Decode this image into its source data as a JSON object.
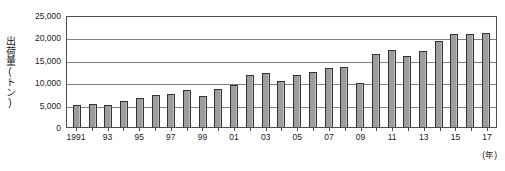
{
  "chart_data": {
    "type": "bar",
    "title": "",
    "subtitle": "",
    "xlabel": "(年)",
    "ylabel": "出荷量(トン)",
    "ylim": [
      0,
      25000
    ],
    "ytick_labels": [
      "25,000",
      "20,000",
      "15,000",
      "10,000",
      "5,000",
      "0"
    ],
    "ytick_values": [
      25000,
      20000,
      15000,
      10000,
      5000,
      0
    ],
    "grid": true,
    "legend": null,
    "categories": [
      "1991",
      "92",
      "93",
      "94",
      "95",
      "96",
      "97",
      "98",
      "99",
      "00",
      "01",
      "02",
      "03",
      "04",
      "05",
      "06",
      "07",
      "08",
      "09",
      "10",
      "11",
      "12",
      "13",
      "14",
      "15",
      "16",
      "17"
    ],
    "xtick_labels_shown": [
      "1991",
      "",
      "93",
      "",
      "95",
      "",
      "97",
      "",
      "99",
      "",
      "01",
      "",
      "03",
      "",
      "05",
      "",
      "07",
      "",
      "09",
      "",
      "11",
      "",
      "13",
      "",
      "15",
      "",
      "17"
    ],
    "values": [
      4900,
      5200,
      4900,
      5900,
      6400,
      7200,
      7400,
      8300,
      6900,
      8400,
      9300,
      11500,
      12000,
      10300,
      11600,
      12300,
      13200,
      13500,
      9800,
      16400,
      17200,
      15900,
      16900,
      19100,
      20800,
      20700,
      21000
    ],
    "series_name": "出荷量",
    "bar_fill_color": "#9d9d9d",
    "bar_border_color": "#333333",
    "gridline_color": "#808080",
    "axis_color": "#4d4d4d"
  }
}
